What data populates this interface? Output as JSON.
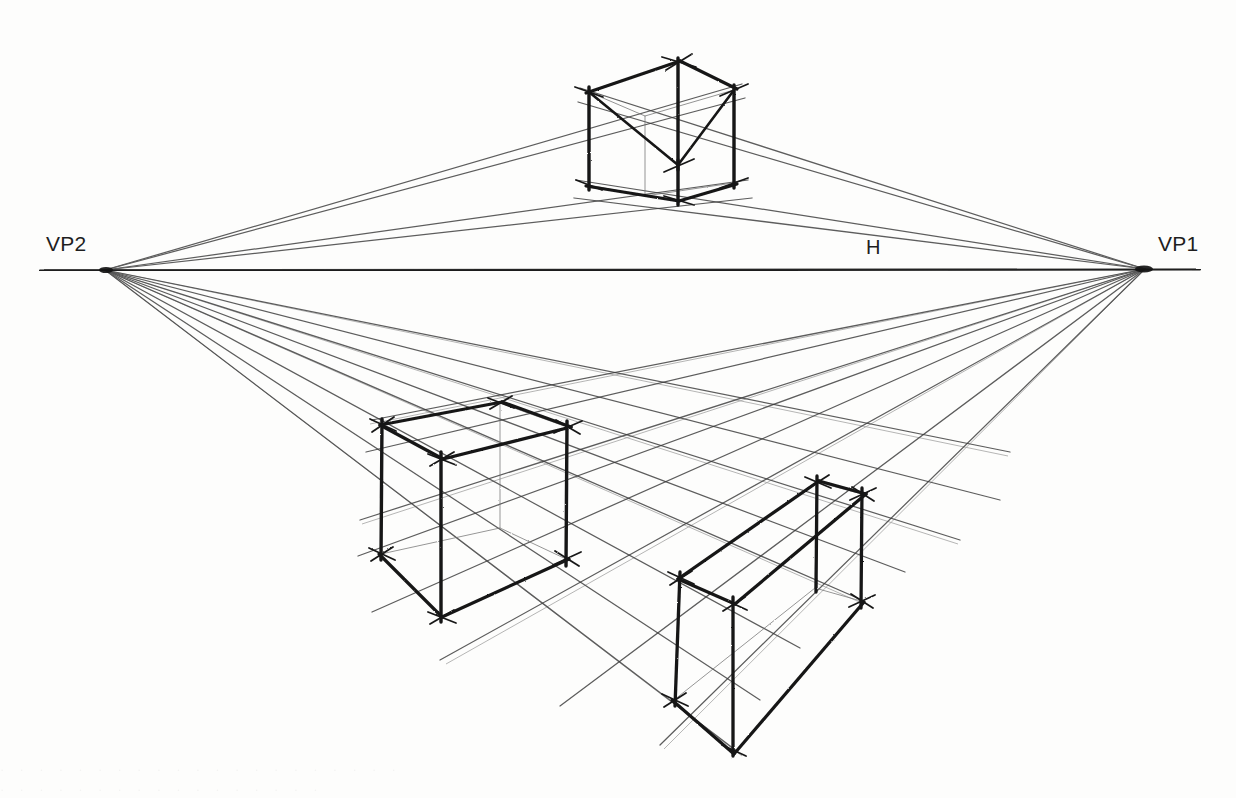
{
  "document": {
    "kind": "pencil-drawing",
    "subject": "two-point perspective construction with three boxes",
    "paper_color": "#fdfdfc",
    "graphite_color": "#1c1c1c",
    "width": 1236,
    "height": 798
  },
  "labels": {
    "vp2": "VP2",
    "vp1": "VP1",
    "horizon": "H"
  },
  "faint_scan_bleed": {
    "row1": "· · ·  ·   ·  ·  ·   ·   ·  ·   ·  ·   ·  ·   ·   ·  ·   ·  ·   ·  ·",
    "row2": "·   ·  ·    ·   ·   ·  ·    ·   ·   ·   ·    ·  ·    ·   ·  ·   ·"
  },
  "geometry": {
    "vanishing_points": {
      "vp2": {
        "x": 105,
        "y": 270
      },
      "vp1": {
        "x": 1145,
        "y": 269
      }
    },
    "horizon_line": {
      "x1": 40,
      "y1": 270,
      "x2": 1200,
      "y2": 269
    },
    "boxes": [
      {
        "name": "upper-box",
        "front_vertical_top": {
          "x": 678,
          "y": 62
        },
        "front_vertical_bottom": {
          "x": 678,
          "y": 200
        },
        "left_top": {
          "x": 589,
          "y": 92
        },
        "left_bottom": {
          "x": 589,
          "y": 185
        },
        "right_top": {
          "x": 734,
          "y": 90
        },
        "right_bottom": {
          "x": 733,
          "y": 183
        },
        "inner_top": {
          "x": 678,
          "y": 165
        },
        "hidden_back_top": {
          "x": 645,
          "y": 118
        },
        "hidden_back_bottom": {
          "x": 645,
          "y": 197
        }
      },
      {
        "name": "lower-left-box",
        "front_vertical_top": {
          "x": 441,
          "y": 458
        },
        "front_vertical_bottom": {
          "x": 441,
          "y": 618
        },
        "left_top": {
          "x": 383,
          "y": 424
        },
        "left_bottom": {
          "x": 381,
          "y": 554
        },
        "right_top": {
          "x": 567,
          "y": 427
        },
        "right_bottom": {
          "x": 566,
          "y": 559
        },
        "back_top": {
          "x": 500,
          "y": 403
        },
        "back_bottom": {
          "x": 500,
          "y": 525
        }
      },
      {
        "name": "lower-right-box",
        "front_vertical_top": {
          "x": 733,
          "y": 603
        },
        "front_vertical_bottom": {
          "x": 733,
          "y": 750
        },
        "left_top": {
          "x": 680,
          "y": 578
        },
        "left_bottom": {
          "x": 674,
          "y": 700
        },
        "right_top": {
          "x": 862,
          "y": 494
        },
        "right_bottom": {
          "x": 861,
          "y": 601
        },
        "back_top": {
          "x": 817,
          "y": 482
        },
        "back_bottom": {
          "x": 815,
          "y": 585
        }
      }
    ],
    "construction_rays_from_vp2": [
      {
        "to_x": 592,
        "to_y": 88
      },
      {
        "to_x": 592,
        "to_y": 101
      },
      {
        "to_x": 592,
        "to_y": 181
      },
      {
        "to_x": 596,
        "to_y": 196
      },
      {
        "to_x": 955,
        "to_y": 470
      },
      {
        "to_x": 905,
        "to_y": 500
      },
      {
        "to_x": 900,
        "to_y": 560
      },
      {
        "to_x": 880,
        "to_y": 620
      },
      {
        "to_x": 800,
        "to_y": 665
      },
      {
        "to_x": 760,
        "to_y": 706
      },
      {
        "to_x": 736,
        "to_y": 752
      }
    ],
    "construction_rays_from_vp1": [
      {
        "to_x": 730,
        "to_y": 86
      },
      {
        "to_x": 730,
        "to_y": 100
      },
      {
        "to_x": 730,
        "to_y": 180
      },
      {
        "to_x": 726,
        "to_y": 196
      },
      {
        "to_x": 378,
        "to_y": 420
      },
      {
        "to_x": 372,
        "to_y": 452
      },
      {
        "to_x": 370,
        "to_y": 520
      },
      {
        "to_x": 370,
        "to_y": 556
      },
      {
        "to_x": 390,
        "to_y": 620
      },
      {
        "to_x": 500,
        "to_y": 680
      },
      {
        "to_x": 620,
        "to_y": 722
      },
      {
        "to_x": 700,
        "to_y": 752
      }
    ]
  }
}
